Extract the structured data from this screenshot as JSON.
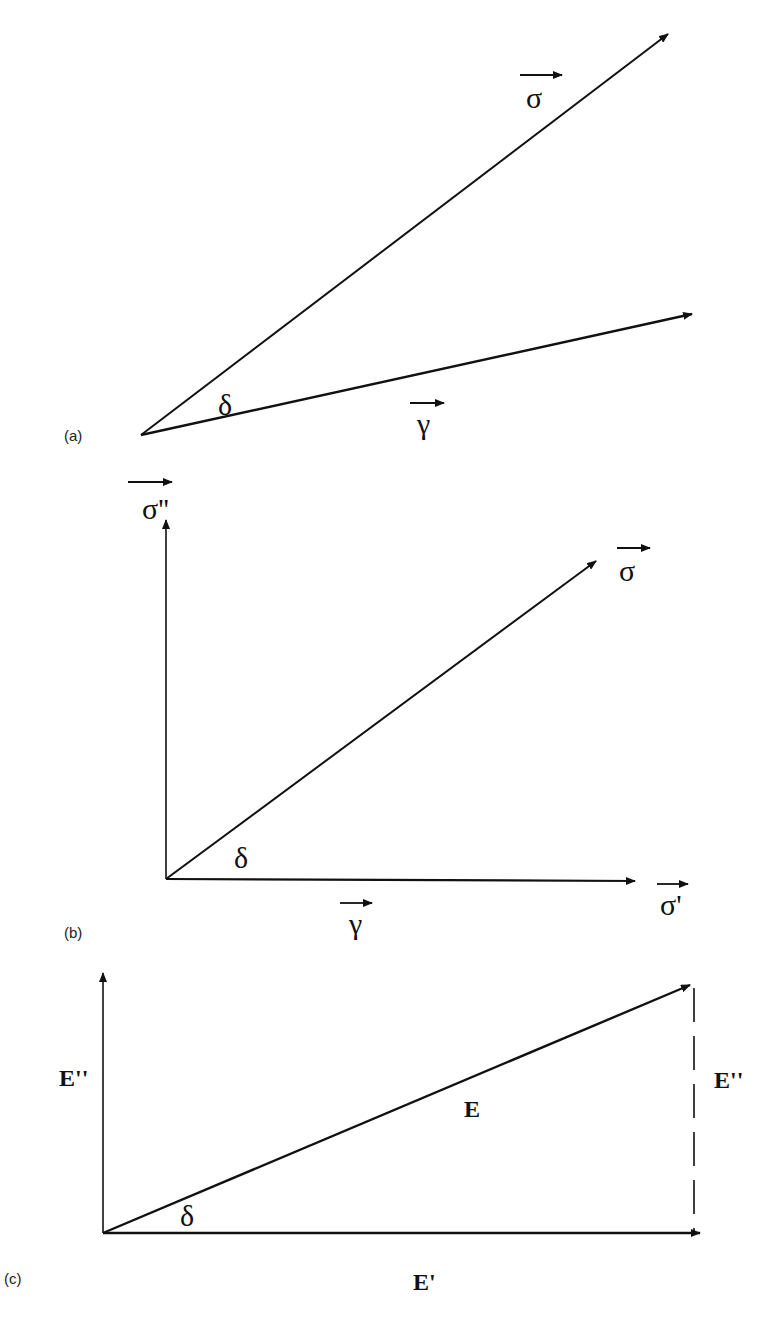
{
  "figure": {
    "panels": [
      {
        "id": "a",
        "label": "(a)",
        "vectors": [
          {
            "name": "sigma",
            "symbol": "σ"
          },
          {
            "name": "gamma",
            "symbol": "γ"
          }
        ],
        "angle_label": "δ"
      },
      {
        "id": "b",
        "label": "(b)",
        "vectors": [
          {
            "name": "sigma",
            "symbol": "σ"
          },
          {
            "name": "sigma-double-prime",
            "symbol": "σ''"
          },
          {
            "name": "sigma-prime",
            "symbol": "σ'"
          },
          {
            "name": "gamma",
            "symbol": "γ"
          }
        ],
        "angle_label": "δ"
      },
      {
        "id": "c",
        "label": "(c)",
        "labels": {
          "y_axis": "E''",
          "hypotenuse": "E",
          "dashed_side": "E''",
          "x_axis": "E'"
        },
        "angle_label": "δ"
      }
    ]
  }
}
